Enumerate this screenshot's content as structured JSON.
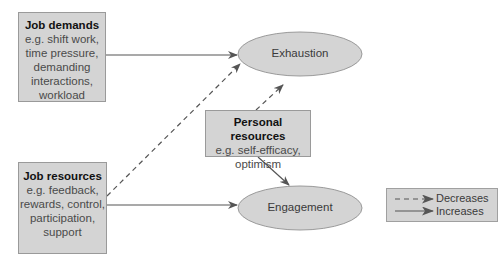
{
  "diagram": {
    "nodes": {
      "job_demands": {
        "title": "Job demands",
        "lines": [
          "e.g. shift work,",
          "time pressure,",
          "demanding",
          "interactions,",
          "workload"
        ]
      },
      "job_resources": {
        "title": "Job resources",
        "lines": [
          "e.g. feedback,",
          "rewards, control,",
          "participation,",
          "support"
        ]
      },
      "personal_resources": {
        "title": "Personal resources",
        "lines": [
          "e.g. self-efficacy,",
          "optimism"
        ]
      },
      "exhaustion": {
        "label": "Exhaustion"
      },
      "engagement": {
        "label": "Engagement"
      }
    },
    "edges": [
      {
        "from": "Job demands",
        "to": "Exhaustion",
        "type": "increases"
      },
      {
        "from": "Job resources",
        "to": "Exhaustion",
        "type": "decreases"
      },
      {
        "from": "Job resources",
        "to": "Engagement",
        "type": "increases"
      },
      {
        "from": "Personal resources",
        "to": "Exhaustion",
        "type": "decreases"
      },
      {
        "from": "Personal resources",
        "to": "Engagement",
        "type": "increases"
      }
    ],
    "legend": {
      "decreases": "Decreases",
      "increases": "Increases"
    },
    "colors": {
      "box_fill": "#d4d4d4",
      "box_border": "#9a9a9a",
      "arrow": "#555555"
    }
  }
}
